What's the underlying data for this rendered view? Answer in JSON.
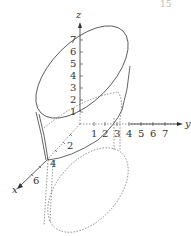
{
  "page_number_fragment": "15",
  "axes": {
    "x": {
      "label": "x",
      "ticks": [
        "2",
        "4",
        "6"
      ]
    },
    "y": {
      "label": "y",
      "ticks": [
        "1",
        "2",
        "3",
        "4",
        "5",
        "6",
        "7"
      ]
    },
    "z": {
      "label": "z",
      "ticks": [
        "1",
        "2",
        "3",
        "4",
        "5",
        "6",
        "7"
      ]
    }
  },
  "surfaces": [
    {
      "name": "upper-ellipse",
      "style": "solid"
    },
    {
      "name": "lower-ellipse",
      "style": "dotted"
    },
    {
      "name": "cylinder-sides",
      "style": "solid/dotted"
    }
  ],
  "colors": {
    "line": "#555555",
    "text": "#333333",
    "background": "#ffffff"
  }
}
